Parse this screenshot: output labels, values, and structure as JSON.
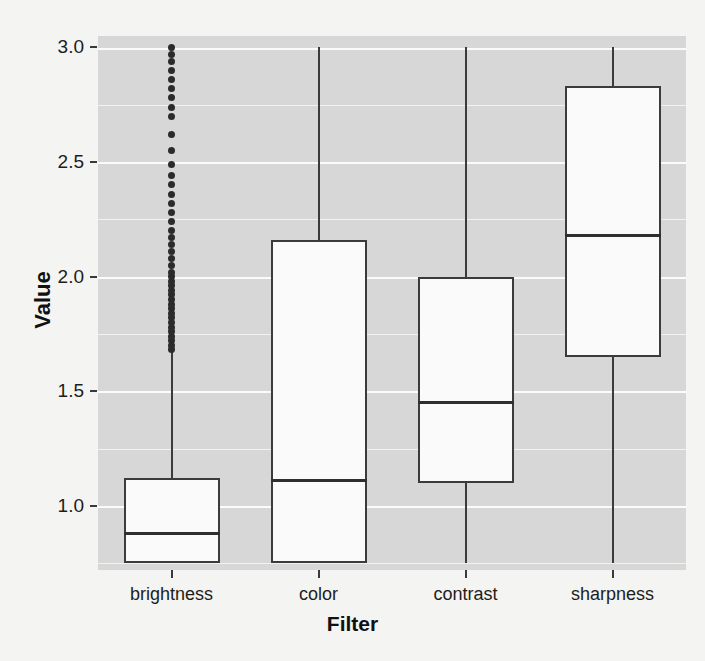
{
  "chart_data": {
    "type": "box",
    "title": "",
    "xlabel": "Filter",
    "ylabel": "Value",
    "categories": [
      "brightness",
      "color",
      "contrast",
      "sharpness"
    ],
    "ylim": [
      0.72,
      3.05
    ],
    "yticks": [
      1.0,
      1.5,
      2.0,
      2.5,
      3.0
    ],
    "ytick_labels": [
      "1.0",
      "1.5",
      "2.0",
      "2.5",
      "3.0"
    ],
    "grid": "horizontal-white-major-and-minor",
    "grid_step": 0.25,
    "legend": "none",
    "boxes": [
      {
        "category": "brightness",
        "whisker_low": 0.75,
        "q1": 0.75,
        "median": 0.88,
        "q3": 1.12,
        "whisker_high": 1.67,
        "outliers": [
          1.68,
          1.7,
          1.72,
          1.74,
          1.76,
          1.78,
          1.8,
          1.82,
          1.84,
          1.86,
          1.88,
          1.9,
          1.92,
          1.94,
          1.96,
          1.98,
          2.0,
          2.02,
          2.05,
          2.08,
          2.11,
          2.14,
          2.17,
          2.2,
          2.24,
          2.28,
          2.32,
          2.36,
          2.4,
          2.44,
          2.49,
          2.55,
          2.62,
          2.7,
          2.74,
          2.78,
          2.82,
          2.86,
          2.9,
          2.94,
          2.97,
          3.0
        ]
      },
      {
        "category": "color",
        "whisker_low": 0.75,
        "q1": 0.75,
        "median": 1.11,
        "q3": 2.16,
        "whisker_high": 3.0,
        "outliers": []
      },
      {
        "category": "contrast",
        "whisker_low": 0.75,
        "q1": 1.1,
        "median": 1.45,
        "q3": 2.0,
        "whisker_high": 3.0,
        "outliers": []
      },
      {
        "category": "sharpness",
        "whisker_low": 0.75,
        "q1": 1.65,
        "median": 2.18,
        "q3": 2.83,
        "whisker_high": 3.0,
        "outliers": []
      }
    ],
    "colors": {
      "panel_background": "#d7d7d7",
      "grid_line": "#f2f2f2",
      "box_fill": "#fafafa",
      "box_stroke": "#3b3b3b",
      "median_stroke": "#2e2e2e",
      "outlier": "#2b2b2b",
      "text": "#1d1d1d",
      "page_background": "#f4f4f2"
    }
  },
  "background_text": {
    "line1": "",
    "line2": "",
    "line3": "",
    "line4": "",
    "line5": "",
    "line6": ""
  }
}
